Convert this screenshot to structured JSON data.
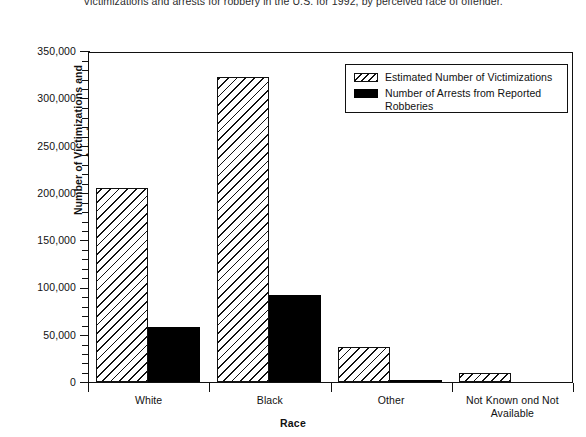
{
  "chart_data": {
    "type": "bar",
    "title": "Victimizations and arrests for robbery in the U.S. for 1992, by perceived race of offender.",
    "xlabel": "Race",
    "ylabel": "Number of Victimizations and Arrests",
    "categories": [
      "White",
      "Black",
      "Other",
      "Not Known ond Not Available"
    ],
    "series": [
      {
        "name": "Estimated Number of Victimizations",
        "fill": "hatch",
        "values": [
          205000,
          323000,
          37000,
          10000
        ]
      },
      {
        "name": "Number of Arrests from Reported Robberies",
        "fill": "solid",
        "values": [
          58000,
          92000,
          2000,
          0
        ]
      }
    ],
    "ylim": [
      0,
      350000
    ],
    "ytick_values": [
      0,
      50000,
      100000,
      150000,
      200000,
      250000,
      300000,
      350000
    ],
    "ytick_labels": [
      "0",
      "50,000",
      "100,000",
      "150,000",
      "200,000",
      "250,000",
      "300,000",
      "350,000"
    ],
    "yminor_step": 10000,
    "grid": false,
    "legend_position": "upper right"
  },
  "legend": {
    "entries": [
      {
        "label": "Estimated Number of Victimizations",
        "swatch": "hatch"
      },
      {
        "label": "Number of Arrests from Reported\nRobberies",
        "swatch": "solid"
      }
    ]
  },
  "colors": {
    "axis": "#111111",
    "bar_solid": "#000000",
    "bar_hatch_line": "#111111",
    "background": "#ffffff"
  }
}
